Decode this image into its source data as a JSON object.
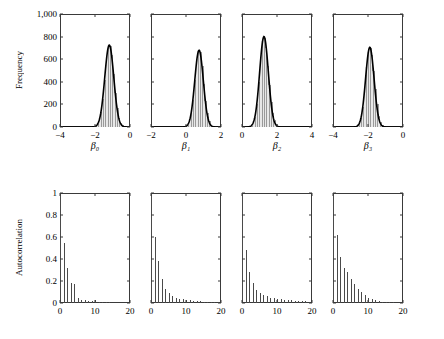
{
  "figure": {
    "top_row_ylabel": "Frequency",
    "bottom_row_ylabel": "Autocorrelation"
  },
  "chart_data": [
    {
      "type": "bar",
      "title": "",
      "panel": "histogram-beta0",
      "xlabel": "β₀",
      "ylabel": "Frequency",
      "xlim": [
        -4,
        0
      ],
      "ylim": [
        0,
        1000
      ],
      "xticks": [
        -4,
        -2,
        0
      ],
      "xticklabels": [
        "−4",
        "−2",
        "0"
      ],
      "yticks": [
        0,
        200,
        400,
        600,
        800,
        1000
      ],
      "yticklabels": [
        "0",
        "200",
        "400",
        "600",
        "800",
        "1,000"
      ],
      "grid": false,
      "legend": "none",
      "bin_centers": [
        -2.05,
        -1.95,
        -1.85,
        -1.75,
        -1.65,
        -1.55,
        -1.45,
        -1.35,
        -1.25,
        -1.15,
        -1.05,
        -0.95,
        -0.85,
        -0.75,
        -0.65,
        -0.55,
        -0.45,
        -0.35,
        -0.25
      ],
      "values": [
        5,
        12,
        30,
        65,
        130,
        250,
        420,
        600,
        700,
        720,
        640,
        470,
        300,
        170,
        80,
        35,
        14,
        6,
        2
      ],
      "density_curve_peak_x": -1.15,
      "density_curve_peak_y": 725
    },
    {
      "type": "bar",
      "title": "",
      "panel": "histogram-beta1",
      "xlabel": "β₁",
      "ylabel": "Frequency",
      "xlim": [
        -2,
        2
      ],
      "ylim": [
        0,
        1000
      ],
      "xticks": [
        -2,
        0,
        2
      ],
      "xticklabels": [
        "−2",
        "0",
        "2"
      ],
      "yticks": [
        0,
        200,
        400,
        600,
        800,
        1000
      ],
      "yticklabels": [
        "0",
        "200",
        "400",
        "600",
        "800",
        "1,000"
      ],
      "grid": false,
      "legend": "none",
      "bin_centers": [
        0.0,
        0.1,
        0.2,
        0.3,
        0.4,
        0.5,
        0.6,
        0.7,
        0.8,
        0.9,
        1.0,
        1.1,
        1.2,
        1.3,
        1.4,
        1.5,
        1.6
      ],
      "values": [
        8,
        22,
        55,
        120,
        240,
        420,
        590,
        670,
        660,
        540,
        380,
        230,
        120,
        55,
        22,
        9,
        3
      ],
      "density_curve_peak_x": 0.7,
      "density_curve_peak_y": 680
    },
    {
      "type": "bar",
      "title": "",
      "panel": "histogram-beta2",
      "xlabel": "β₂",
      "ylabel": "Frequency",
      "xlim": [
        0,
        4
      ],
      "ylim": [
        0,
        1000
      ],
      "xticks": [
        0,
        2,
        4
      ],
      "xticklabels": [
        "0",
        "2",
        "4"
      ],
      "yticks": [
        0,
        200,
        400,
        600,
        800,
        1000
      ],
      "yticklabels": [
        "0",
        "200",
        "400",
        "600",
        "800",
        "1,000"
      ],
      "grid": false,
      "legend": "none",
      "bin_centers": [
        0.55,
        0.65,
        0.75,
        0.85,
        0.95,
        1.05,
        1.15,
        1.25,
        1.35,
        1.45,
        1.55,
        1.65,
        1.75,
        1.85,
        1.95,
        2.05,
        2.15
      ],
      "values": [
        10,
        30,
        85,
        200,
        400,
        620,
        760,
        790,
        700,
        540,
        370,
        220,
        120,
        60,
        25,
        10,
        4
      ],
      "density_curve_peak_x": 1.25,
      "density_curve_peak_y": 800
    },
    {
      "type": "bar",
      "title": "",
      "panel": "histogram-beta3",
      "xlabel": "β₃",
      "ylabel": "Frequency",
      "xlim": [
        -4,
        0
      ],
      "ylim": [
        0,
        1000
      ],
      "xticks": [
        -4,
        -2,
        0
      ],
      "xticklabels": [
        "−4",
        "−2",
        "0"
      ],
      "yticks": [
        0,
        200,
        400,
        600,
        800,
        1000
      ],
      "yticklabels": [
        "0",
        "200",
        "400",
        "600",
        "800",
        "1,000"
      ],
      "grid": false,
      "legend": "none",
      "bin_centers": [
        -2.6,
        -2.5,
        -2.4,
        -2.3,
        -2.2,
        -2.1,
        -2.0,
        -1.9,
        -1.8,
        -1.7,
        -1.6,
        -1.5,
        -1.4,
        -1.3,
        -1.2
      ],
      "values": [
        10,
        30,
        80,
        180,
        340,
        530,
        660,
        700,
        640,
        500,
        340,
        200,
        100,
        40,
        14
      ],
      "density_curve_peak_x": -1.9,
      "density_curve_peak_y": 705
    },
    {
      "type": "bar",
      "panel": "autocorrelation-beta0",
      "xlabel": "",
      "ylabel": "Autocorrelation",
      "xlim": [
        0,
        20
      ],
      "ylim": [
        0,
        1
      ],
      "xticks": [
        0,
        10,
        20
      ],
      "xticklabels": [
        "0",
        "10",
        "20"
      ],
      "yticks": [
        0,
        0.2,
        0.4,
        0.6,
        0.8,
        1
      ],
      "yticklabels": [
        "0",
        "0.2",
        "0.4",
        "0.6",
        "0.8",
        "1"
      ],
      "grid": false,
      "legend": "none",
      "lags": [
        0,
        1,
        2,
        3,
        4,
        5,
        6,
        7,
        8,
        9,
        10,
        11,
        12,
        13,
        14,
        15,
        16,
        17,
        18,
        19,
        20
      ],
      "values": [
        1.0,
        0.55,
        0.32,
        0.18,
        0.17,
        0.05,
        0.03,
        0.025,
        0.02,
        0.02,
        0.025,
        0.01,
        0.008,
        0.006,
        0.005,
        0.004,
        0.004,
        0.003,
        0.003,
        0.002,
        0.002
      ]
    },
    {
      "type": "bar",
      "panel": "autocorrelation-beta1",
      "xlabel": "",
      "ylabel": "Autocorrelation",
      "xlim": [
        0,
        20
      ],
      "ylim": [
        0,
        1
      ],
      "xticks": [
        0,
        10,
        20
      ],
      "xticklabels": [
        "0",
        "10",
        "20"
      ],
      "yticks": [
        0,
        0.2,
        0.4,
        0.6,
        0.8,
        1
      ],
      "yticklabels": [
        "0",
        "0.2",
        "0.4",
        "0.6",
        "0.8",
        "1"
      ],
      "grid": false,
      "legend": "none",
      "lags": [
        0,
        1,
        2,
        3,
        4,
        5,
        6,
        7,
        8,
        9,
        10,
        11,
        12,
        13,
        14,
        15,
        16,
        17,
        18,
        19,
        20
      ],
      "values": [
        1.0,
        0.6,
        0.38,
        0.22,
        0.13,
        0.09,
        0.06,
        0.05,
        0.04,
        0.035,
        0.03,
        0.025,
        0.02,
        0.018,
        0.015,
        0.012,
        0.01,
        0.008,
        0.007,
        0.006,
        0.005
      ]
    },
    {
      "type": "bar",
      "panel": "autocorrelation-beta2",
      "xlabel": "",
      "ylabel": "Autocorrelation",
      "xlim": [
        0,
        20
      ],
      "ylim": [
        0,
        1
      ],
      "xticks": [
        0,
        10,
        20
      ],
      "xticklabels": [
        "0",
        "10",
        "20"
      ],
      "yticks": [
        0,
        0.2,
        0.4,
        0.6,
        0.8,
        1
      ],
      "yticklabels": [
        "0",
        "0.2",
        "0.4",
        "0.6",
        "0.8",
        "1"
      ],
      "grid": false,
      "legend": "none",
      "lags": [
        0,
        1,
        2,
        3,
        4,
        5,
        6,
        7,
        8,
        9,
        10,
        11,
        12,
        13,
        14,
        15,
        16,
        17,
        18,
        19,
        20
      ],
      "values": [
        1.0,
        0.48,
        0.28,
        0.18,
        0.12,
        0.09,
        0.07,
        0.06,
        0.05,
        0.045,
        0.04,
        0.035,
        0.03,
        0.028,
        0.025,
        0.022,
        0.02,
        0.018,
        0.015,
        0.012,
        0.01
      ]
    },
    {
      "type": "bar",
      "panel": "autocorrelation-beta3",
      "xlabel": "",
      "ylabel": "Autocorrelation",
      "xlim": [
        0,
        20
      ],
      "ylim": [
        0,
        1
      ],
      "xticks": [
        0,
        10,
        20
      ],
      "xticklabels": [
        "0",
        "10",
        "20"
      ],
      "yticks": [
        0,
        0.2,
        0.4,
        0.6,
        0.8,
        1
      ],
      "yticklabels": [
        "0",
        "0.2",
        "0.4",
        "0.6",
        "0.8",
        "1"
      ],
      "grid": false,
      "legend": "none",
      "lags": [
        0,
        1,
        2,
        3,
        4,
        5,
        6,
        7,
        8,
        9,
        10,
        11,
        12,
        13,
        14,
        15,
        16,
        17,
        18,
        19,
        20
      ],
      "values": [
        1.0,
        0.62,
        0.42,
        0.32,
        0.28,
        0.22,
        0.17,
        0.13,
        0.1,
        0.07,
        0.05,
        0.035,
        0.025,
        0.018,
        0.012,
        0.009,
        0.007,
        0.005,
        0.004,
        0.003,
        0.002
      ]
    }
  ]
}
